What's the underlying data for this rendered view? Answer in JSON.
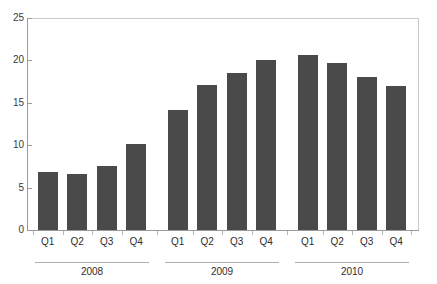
{
  "chart_data": {
    "type": "bar",
    "title": "",
    "subtitle": "",
    "xlabel": "",
    "ylabel": "",
    "ylim": [
      0,
      25
    ],
    "yticks": [
      0,
      5,
      10,
      15,
      20,
      25
    ],
    "grid": false,
    "legend": "none",
    "bar_color": "#4a4a4a",
    "axis_color": "#9a9a9a",
    "categories": [
      "Q1",
      "Q2",
      "Q3",
      "Q4",
      "Q1",
      "Q2",
      "Q3",
      "Q4",
      "Q1",
      "Q2",
      "Q3",
      "Q4"
    ],
    "values": [
      6.9,
      6.6,
      7.6,
      10.1,
      14.2,
      17.1,
      18.5,
      20.0,
      20.6,
      19.7,
      18.0,
      17.0
    ],
    "groups": [
      {
        "label": "2008",
        "categories": [
          "Q1",
          "Q2",
          "Q3",
          "Q4"
        ],
        "values": [
          6.9,
          6.6,
          7.6,
          10.1
        ]
      },
      {
        "label": "2009",
        "categories": [
          "Q1",
          "Q2",
          "Q3",
          "Q4"
        ],
        "values": [
          14.2,
          17.1,
          18.5,
          20.0
        ]
      },
      {
        "label": "2010",
        "categories": [
          "Q1",
          "Q2",
          "Q3",
          "Q4"
        ],
        "values": [
          20.6,
          19.7,
          18.0,
          17.0
        ]
      }
    ]
  }
}
